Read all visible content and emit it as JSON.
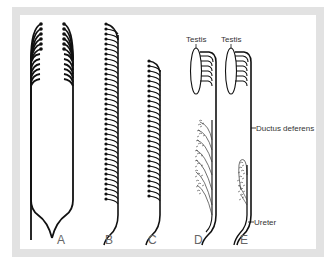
{
  "figure": {
    "panels": [
      {
        "id": "A",
        "label": "A"
      },
      {
        "id": "B",
        "label": "B"
      },
      {
        "id": "C",
        "label": "C"
      },
      {
        "id": "D",
        "label": "D"
      },
      {
        "id": "E",
        "label": "E"
      }
    ],
    "annotations": {
      "testis_d": "Testis",
      "testis_e": "Testis",
      "ductus_deferens": "Ductus deferens",
      "ureter": "Ureter"
    },
    "colors": {
      "frame": "#e2e2e2",
      "line": "#111111",
      "background": "#ffffff"
    }
  }
}
